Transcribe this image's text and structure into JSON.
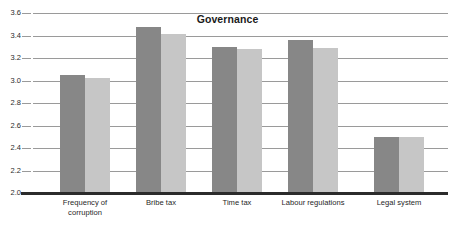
{
  "chart_data": {
    "type": "bar",
    "title": "Governance",
    "xlabel": "",
    "ylabel": "",
    "ylim": [
      2.0,
      3.6
    ],
    "ytick_step": 0.2,
    "yticks": [
      "3.6",
      "3.4",
      "3.2",
      "3.0",
      "2.8",
      "2.6",
      "2.4",
      "2.2",
      "2.0"
    ],
    "ytick_values": [
      3.6,
      3.4,
      3.2,
      3.0,
      2.8,
      2.6,
      2.4,
      2.2,
      2.0
    ],
    "grid": true,
    "legend": "none",
    "categories": [
      "Frequency of corruption",
      "Bribe tax",
      "Time tax",
      "Labour regulations",
      "Legal system"
    ],
    "category_lines": [
      [
        "Frequency of",
        "corruption"
      ],
      [
        "Bribe tax"
      ],
      [
        "Time tax"
      ],
      [
        "Labour regulations"
      ],
      [
        "Legal system"
      ]
    ],
    "series": [
      {
        "name": "series-1",
        "color": "#878787",
        "values": [
          3.05,
          3.48,
          3.3,
          3.36,
          2.5
        ]
      },
      {
        "name": "series-2",
        "color": "#c6c6c6",
        "values": [
          3.02,
          3.41,
          3.28,
          3.29,
          2.5
        ]
      }
    ]
  },
  "colors": {
    "series_dark": "#878787",
    "series_light": "#c6c6c6",
    "gridline": "#9a9a9a",
    "axis": "#2b2b2b",
    "background": "#ffffff",
    "text": "#1f1f1f"
  }
}
